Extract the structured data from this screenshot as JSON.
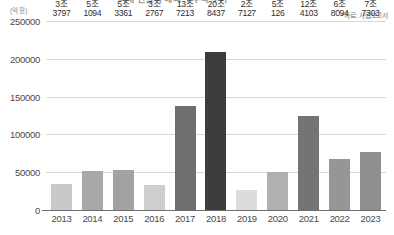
{
  "chart_data": {
    "type": "bar",
    "title": "",
    "xlabel": "",
    "ylabel": "(억 원)",
    "ylim": [
      0,
      250000
    ],
    "yticks": [
      0,
      50000,
      100000,
      150000,
      200000,
      250000
    ],
    "ytick_labels": [
      "0",
      "50000",
      "100000",
      "150000",
      "200000",
      "250000"
    ],
    "grid": true,
    "legend": "none",
    "source_note": "*자료: 사업보고서",
    "unit": "(억 원)",
    "categories": [
      "2013",
      "2014",
      "2015",
      "2016",
      "2017",
      "2018",
      "2019",
      "2020",
      "2021",
      "2022",
      "2023"
    ],
    "values": [
      33797,
      51094,
      53361,
      32767,
      137213,
      208437,
      27127,
      50126,
      124103,
      68094,
      77303
    ],
    "data_labels": [
      "3조\n3797",
      "5조\n1094",
      "5조\n3361",
      "3조\n2767",
      "13조\n7213",
      "20조\n8437",
      "2조\n7127",
      "5조\n126",
      "12조\n4103",
      "6조\n8094",
      "7조\n7303"
    ],
    "bars": [
      {
        "category": "2013",
        "value": 33797,
        "label_top": "3조",
        "label_bottom": "3797",
        "color": "#c9c9c9"
      },
      {
        "category": "2014",
        "value": 51094,
        "label_top": "5조",
        "label_bottom": "1094",
        "color": "#a8a8a8"
      },
      {
        "category": "2015",
        "value": 53361,
        "label_top": "5조",
        "label_bottom": "3361",
        "color": "#a2a2a2"
      },
      {
        "category": "2016",
        "value": 32767,
        "label_top": "3조",
        "label_bottom": "2767",
        "color": "#cecece"
      },
      {
        "category": "2017",
        "value": 137213,
        "label_top": "13조",
        "label_bottom": "7213",
        "color": "#6e6e6e"
      },
      {
        "category": "2018",
        "value": 208437,
        "label_top": "20조",
        "label_bottom": "8437",
        "color": "#3d3d3d"
      },
      {
        "category": "2019",
        "value": 27127,
        "label_top": "2조",
        "label_bottom": "7127",
        "color": "#dcdcdc"
      },
      {
        "category": "2020",
        "value": 50126,
        "label_top": "5조",
        "label_bottom": "126",
        "color": "#b0b0b0"
      },
      {
        "category": "2021",
        "value": 124103,
        "label_top": "12조",
        "label_bottom": "4103",
        "color": "#747474"
      },
      {
        "category": "2022",
        "value": 68094,
        "label_top": "6조",
        "label_bottom": "8094",
        "color": "#969696"
      },
      {
        "category": "2023",
        "value": 77303,
        "label_top": "7조",
        "label_bottom": "7303",
        "color": "#8e8e8e"
      }
    ]
  },
  "header": {
    "title_clipped": "국내 건설사 해외 수주액 추이"
  }
}
